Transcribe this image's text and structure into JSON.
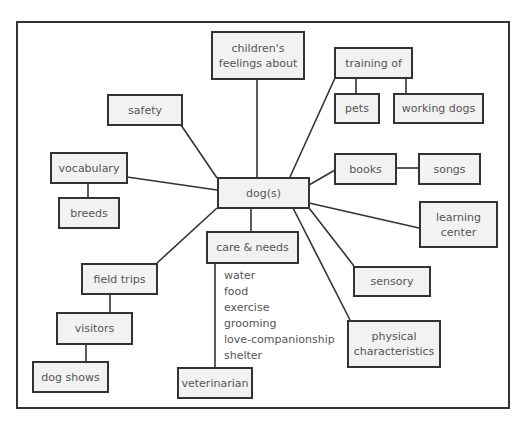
{
  "diagram": {
    "type": "concept-map",
    "center": {
      "id": "dog",
      "label": "dog(s)"
    },
    "nodes": {
      "childrens_feelings": {
        "label_line1": "children's",
        "label_line2": "feelings about"
      },
      "training_of": {
        "label": "training of"
      },
      "pets": {
        "label": "pets"
      },
      "working_dogs": {
        "label": "working dogs"
      },
      "safety": {
        "label": "safety"
      },
      "vocabulary": {
        "label": "vocabulary"
      },
      "breeds": {
        "label": "breeds"
      },
      "books": {
        "label": "books"
      },
      "songs": {
        "label": "songs"
      },
      "learning_center": {
        "label_line1": "learning",
        "label_line2": "center"
      },
      "care_needs": {
        "label": "care & needs"
      },
      "sensory": {
        "label": "sensory"
      },
      "physical": {
        "label_line1": "physical",
        "label_line2": "characteristics"
      },
      "field_trips": {
        "label": "field trips"
      },
      "visitors": {
        "label": "visitors"
      },
      "dog_shows": {
        "label": "dog shows"
      },
      "veterinarian": {
        "label": "veterinarian"
      }
    },
    "care_list": [
      "water",
      "food",
      "exercise",
      "grooming",
      "love-companionship",
      "shelter"
    ],
    "edges": [
      [
        "dog",
        "childrens_feelings"
      ],
      [
        "dog",
        "training_of"
      ],
      [
        "training_of",
        "pets"
      ],
      [
        "training_of",
        "working_dogs"
      ],
      [
        "dog",
        "safety"
      ],
      [
        "dog",
        "vocabulary"
      ],
      [
        "vocabulary",
        "breeds"
      ],
      [
        "dog",
        "books"
      ],
      [
        "books",
        "songs"
      ],
      [
        "dog",
        "learning_center"
      ],
      [
        "dog",
        "care_needs"
      ],
      [
        "care_needs",
        "veterinarian"
      ],
      [
        "dog",
        "sensory"
      ],
      [
        "dog",
        "physical"
      ],
      [
        "dog",
        "field_trips"
      ],
      [
        "field_trips",
        "visitors"
      ],
      [
        "visitors",
        "dog_shows"
      ]
    ],
    "colors": {
      "box_fill": "#f2f2f2",
      "stroke": "#333333",
      "text": "#555555"
    }
  }
}
